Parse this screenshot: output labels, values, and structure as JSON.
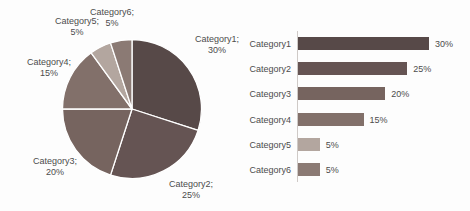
{
  "page": {
    "background_color": "#fdfdfd",
    "text_color": "#4c4c4c"
  },
  "chart_data": [
    {
      "type": "pie",
      "title": "",
      "categories": [
        "Category1",
        "Category2",
        "Category3",
        "Category4",
        "Category5",
        "Category6"
      ],
      "values": [
        30,
        25,
        20,
        15,
        5,
        5
      ],
      "unit": "%",
      "start_angle_deg": 0,
      "direction": "clockwise",
      "legend": "none",
      "label_position": "outside-end",
      "label_separator": ";",
      "slice_border_color": "#ffffff",
      "colors": [
        "#574948",
        "#655453",
        "#76645f",
        "#82706a",
        "#b3a69f",
        "#8b7a74"
      ],
      "point_labels": [
        {
          "name": "Category1;",
          "value": "30%"
        },
        {
          "name": "Category2;",
          "value": "25%"
        },
        {
          "name": "Category3;",
          "value": "20%"
        },
        {
          "name": "Category4;",
          "value": "15%"
        },
        {
          "name": "Category5;",
          "value": "5%"
        },
        {
          "name": "Category6;",
          "value": "5%"
        }
      ]
    },
    {
      "type": "bar",
      "orientation": "horizontal",
      "title": "",
      "categories": [
        "Category1",
        "Category2",
        "Category3",
        "Category4",
        "Category5",
        "Category6"
      ],
      "values": [
        30,
        25,
        20,
        15,
        5,
        5
      ],
      "value_labels": [
        "30%",
        "25%",
        "20%",
        "15%",
        "5%",
        "5%"
      ],
      "xlim": [
        0,
        30
      ],
      "gridlines": "off",
      "legend": "none",
      "axis_line_color": "#cfcac7",
      "colors": [
        "#574948",
        "#655453",
        "#76645f",
        "#82706a",
        "#b3a69f",
        "#8b7a74"
      ]
    }
  ]
}
